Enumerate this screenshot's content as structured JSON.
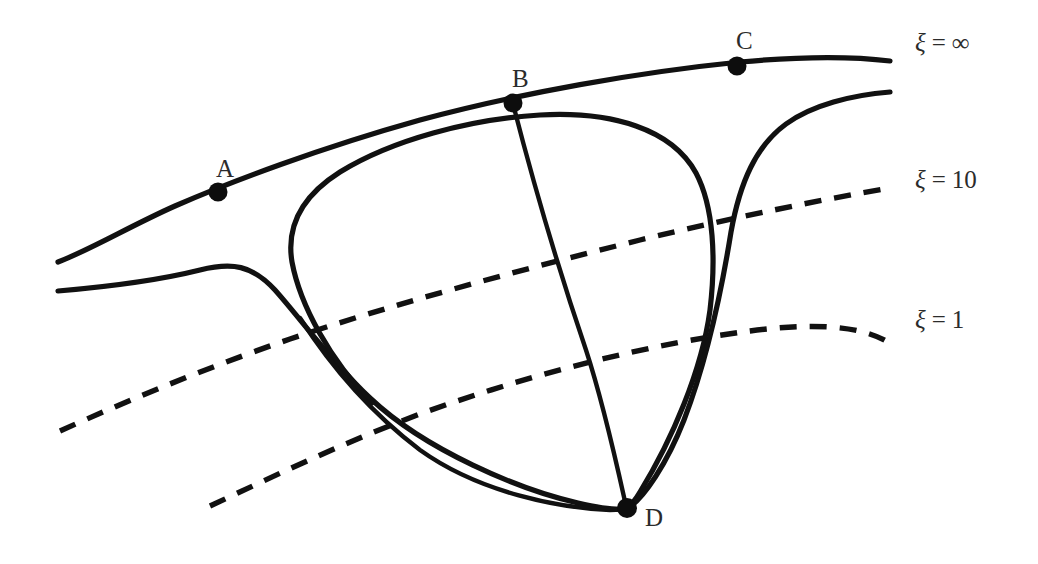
{
  "figure": {
    "background_color": "#ffffff",
    "stroke_color": "#111111",
    "width": 1038,
    "height": 564
  },
  "nodes": [
    {
      "id": "A",
      "label": "A",
      "x": 218,
      "y": 192,
      "label_x": 216,
      "label_y": 156
    },
    {
      "id": "B",
      "label": "B",
      "x": 513,
      "y": 103,
      "label_x": 512,
      "label_y": 66
    },
    {
      "id": "C",
      "label": "C",
      "x": 737,
      "y": 66,
      "label_x": 736,
      "label_y": 28
    },
    {
      "id": "D",
      "label": "D",
      "x": 627,
      "y": 508,
      "label_x": 645,
      "label_y": 505
    }
  ],
  "level_labels": [
    {
      "id": "xi-infinity",
      "symbol": "ξ",
      "equals": "=",
      "value": "∞",
      "x": 915,
      "y": 30
    },
    {
      "id": "xi-10",
      "symbol": "ξ",
      "equals": "=",
      "value": "10",
      "x": 915,
      "y": 167
    },
    {
      "id": "xi-1",
      "symbol": "ξ",
      "equals": "=",
      "value": "1",
      "x": 915,
      "y": 307
    }
  ],
  "curves": [
    {
      "id": "xi-infinity-boundary",
      "style": "solid",
      "description": "upper boundary curve passing through points A, B and C"
    },
    {
      "id": "left-horizon-branch",
      "style": "solid",
      "description": "lower-left solid curve descending from the left edge toward D"
    },
    {
      "id": "dome-outer",
      "style": "solid",
      "description": "closed dome curve from left turning point up to the upper boundary and down the right throat to D"
    },
    {
      "id": "right-horizon-branch",
      "style": "solid",
      "description": "solid curve entering from the right edge, descending through the throat to D"
    },
    {
      "id": "b-to-d-geodesic",
      "style": "solid",
      "description": "nearly straight curve linking B on the boundary to D"
    },
    {
      "id": "xi-10-surface",
      "style": "dashed",
      "description": "dashed surface of constant xi equal to 10"
    },
    {
      "id": "xi-1-surface",
      "style": "dashed",
      "description": "dashed surface of constant xi equal to 1"
    }
  ]
}
